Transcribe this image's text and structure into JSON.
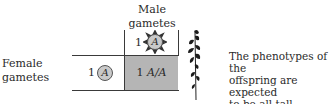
{
  "diagram": {
    "type": "punnett-square",
    "male_label_line1": "Male",
    "male_label_line2": "gametes",
    "female_label_line1": "Female",
    "female_label_line2": "gametes",
    "male_gamete": {
      "count": "1",
      "allele": "A",
      "icon": "sperm-cell-icon"
    },
    "female_gamete": {
      "count": "1",
      "allele": "A",
      "icon": "egg-cell-icon"
    },
    "offspring": {
      "count": "1",
      "genotype": "A/A"
    },
    "offspring_icon": "tall-plant-icon",
    "caption_line1": "The phenotypes of the",
    "caption_line2": "offspring are expected",
    "caption_line3": "to be all tall",
    "colors": {
      "shaded_cell": "#b5b5b5",
      "allele_circle": "#c9c9c9",
      "lines": "#3a3a3a",
      "plant": "#1a1a1a"
    }
  }
}
